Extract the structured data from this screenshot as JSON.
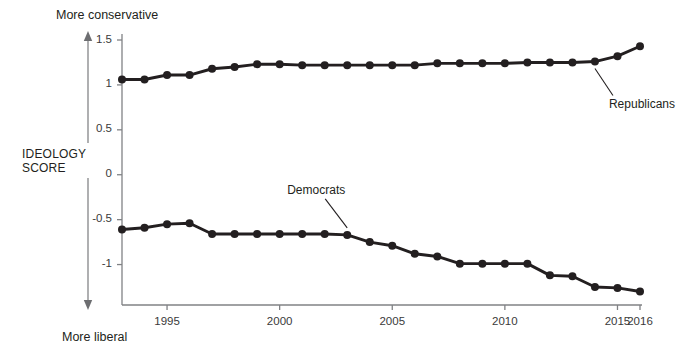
{
  "chart_data": {
    "type": "line",
    "title": "",
    "subtitle": "",
    "xlabel": "",
    "ylabel": "IDEOLOGY SCORE",
    "y_axis_direction_top": "More conservative",
    "y_axis_direction_bottom": "More liberal",
    "grid": false,
    "legend_position": "inline-annotation",
    "xlim": [
      1993,
      2016
    ],
    "ylim": [
      -1.35,
      1.5
    ],
    "yticks": [
      1.5,
      1,
      0.5,
      0,
      -0.5,
      -1
    ],
    "ytick_labels": [
      "1.5",
      "1",
      "0.5",
      "0",
      "-0.5",
      "-1"
    ],
    "xticks": [
      1995,
      2000,
      2005,
      2010,
      2015,
      2016
    ],
    "xtick_labels": [
      "1995",
      "2000",
      "2005",
      "2010",
      "2015",
      "2016"
    ],
    "x": [
      1993,
      1994,
      1995,
      1996,
      1997,
      1998,
      1999,
      2000,
      2001,
      2002,
      2003,
      2004,
      2005,
      2006,
      2007,
      2008,
      2009,
      2010,
      2011,
      2012,
      2013,
      2014,
      2015,
      2016
    ],
    "series": [
      {
        "name": "Republicans",
        "color": "#231f20",
        "marker": "circle",
        "values": [
          1.06,
          1.06,
          1.11,
          1.11,
          1.18,
          1.2,
          1.23,
          1.23,
          1.22,
          1.22,
          1.22,
          1.22,
          1.22,
          1.22,
          1.24,
          1.24,
          1.24,
          1.24,
          1.25,
          1.25,
          1.25,
          1.26,
          1.32,
          1.43
        ]
      },
      {
        "name": "Democrats",
        "color": "#231f20",
        "marker": "circle",
        "values": [
          -0.61,
          -0.59,
          -0.55,
          -0.54,
          -0.66,
          -0.66,
          -0.66,
          -0.66,
          -0.66,
          -0.66,
          -0.67,
          -0.75,
          -0.79,
          -0.88,
          -0.91,
          -0.99,
          -0.99,
          -0.99,
          -0.99,
          -1.12,
          -1.13,
          -1.25,
          -1.26,
          -1.3
        ]
      }
    ],
    "annotations": [
      {
        "text": "Republicans",
        "target_x": 2014,
        "target_y": 1.26
      },
      {
        "text": "Democrats",
        "target_x": 2003,
        "target_y": -0.67
      }
    ]
  }
}
